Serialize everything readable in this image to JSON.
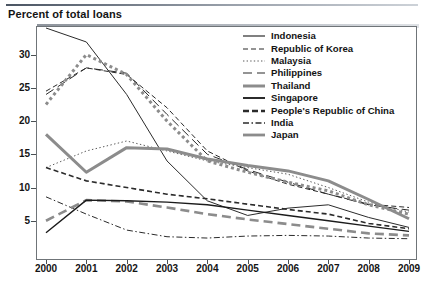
{
  "chart_title": "Percent of total loans",
  "axis": {
    "y_ticks": [
      "5",
      "10",
      "15",
      "20",
      "25",
      "30"
    ],
    "x_ticks": [
      "2000",
      "2001",
      "2002",
      "2003",
      "2004",
      "2005",
      "2006",
      "2007",
      "2008",
      "2009"
    ]
  },
  "legend": {
    "items": [
      {
        "label": "Indonesia",
        "style": "thin-solid"
      },
      {
        "label": "Republic of Korea",
        "style": "thin-dash"
      },
      {
        "label": "Malaysia",
        "style": "thin-dot"
      },
      {
        "label": "Philippines",
        "style": "thin-longdash"
      },
      {
        "label": "Thailand",
        "style": "thick-gray-dot"
      },
      {
        "label": "Singapore",
        "style": "thick-solid"
      },
      {
        "label": "People's Republic of China",
        "style": "thick-gray-dash"
      },
      {
        "label": "India",
        "style": "thin-dashdot"
      },
      {
        "label": "Japan",
        "style": "thick-gray-longdash"
      }
    ]
  },
  "chart_data": {
    "type": "line",
    "title": "Percent of total loans",
    "xlabel": "",
    "ylabel": "Percent of total loans",
    "x": [
      2000,
      2001,
      2002,
      2003,
      2004,
      2005,
      2006,
      2007,
      2008,
      2009
    ],
    "xlim": [
      2000,
      2009
    ],
    "ylim": [
      0,
      34
    ],
    "y_ticks": [
      5,
      10,
      15,
      20,
      25,
      30
    ],
    "grid": false,
    "legend_position": "top-right-inside",
    "series": [
      {
        "name": "Indonesia",
        "color": "#2b2b2b",
        "width": 1,
        "dash": "solid",
        "values": [
          34.0,
          31.9,
          24.0,
          14.0,
          8.0,
          5.8,
          6.9,
          7.4,
          5.5,
          4.0
        ]
      },
      {
        "name": "Republic of Korea",
        "color": "#2b2b2b",
        "width": 1,
        "dash": "dash",
        "values": [
          24.5,
          28.0,
          27.0,
          22.0,
          15.5,
          12.5,
          10.5,
          9.0,
          7.5,
          7.0
        ]
      },
      {
        "name": "Malaysia",
        "color": "#5a5a5a",
        "width": 1,
        "dash": "dot",
        "values": [
          13.0,
          15.5,
          17.0,
          15.5,
          14.0,
          13.0,
          12.0,
          10.0,
          7.8,
          6.3
        ]
      },
      {
        "name": "Philippines",
        "color": "#2b2b2b",
        "width": 1,
        "dash": "longdash",
        "values": [
          24.0,
          28.0,
          27.2,
          21.0,
          15.0,
          12.7,
          10.8,
          9.0,
          7.4,
          6.6
        ]
      },
      {
        "name": "Thailand",
        "color": "#8c8c8c",
        "width": 3,
        "dash": "dot",
        "values": [
          22.5,
          30.0,
          27.0,
          20.0,
          14.0,
          12.3,
          10.8,
          9.5,
          7.4,
          6.0
        ]
      },
      {
        "name": "Singapore",
        "color": "#8c8c8c",
        "width": 3,
        "dash": "solid",
        "values": [
          18.0,
          12.3,
          16.0,
          15.8,
          14.3,
          13.3,
          12.5,
          11.0,
          8.2,
          5.3
        ]
      },
      {
        "name": "People's Republic of China",
        "color": "#2b2b2b",
        "width": 1.6,
        "dash": "dash",
        "values": [
          13.0,
          11.0,
          10.0,
          9.0,
          8.3,
          7.5,
          6.7,
          6.0,
          4.6,
          3.8
        ]
      },
      {
        "name": "India",
        "color": "#2b2b2b",
        "width": 1,
        "dash": "dashdot",
        "values": [
          8.6,
          6.0,
          3.6,
          2.6,
          2.4,
          2.7,
          2.8,
          2.7,
          2.4,
          2.3
        ]
      },
      {
        "name": "Japan",
        "color": "#8c8c8c",
        "width": 2.6,
        "dash": "longdash",
        "values": [
          5.0,
          8.1,
          7.9,
          7.0,
          6.0,
          5.2,
          4.5,
          3.8,
          3.1,
          2.8
        ]
      },
      {
        "name": "Singapore-dark",
        "color": "#1b1b1b",
        "width": 1.4,
        "dash": "solid",
        "values": [
          3.2,
          8.1,
          8.0,
          7.8,
          7.4,
          6.6,
          5.8,
          5.0,
          4.2,
          3.4
        ]
      }
    ]
  }
}
